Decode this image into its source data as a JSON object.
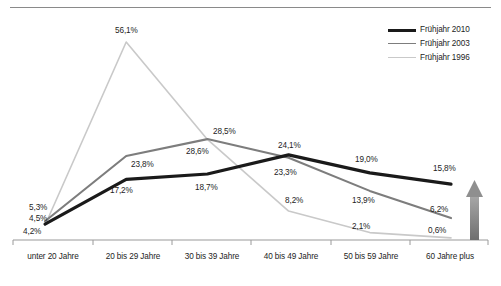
{
  "chart_data": {
    "type": "line",
    "title": "",
    "xlabel": "",
    "ylabel": "",
    "ylim": [
      0,
      60
    ],
    "grid": false,
    "legend_position": "top-right",
    "categories": [
      "unter 20 Jahre",
      "20 bis 29 Jahre",
      "30 bis 39 Jahre",
      "40 bis 49 Jahre",
      "50 bis 59 Jahre",
      "60 Jahre plus"
    ],
    "series": [
      {
        "name": "Frühjahr 2010",
        "color": "#1a1a1a",
        "values": [
          4.5,
          17.2,
          18.7,
          24.1,
          19.0,
          15.8
        ],
        "labels": [
          "4,5%",
          "17,2%",
          "18,7%",
          "24,1%",
          "19,0%",
          "15,8%"
        ]
      },
      {
        "name": "Frühjahr 2003",
        "color": "#7d7d7d",
        "values": [
          5.3,
          23.8,
          28.6,
          23.3,
          13.9,
          6.2
        ],
        "labels": [
          "5,3%",
          "23,8%",
          "28,6%",
          "23,3%",
          "13,9%",
          "6,2%"
        ]
      },
      {
        "name": "Frühjahr 1996",
        "color": "#c9c9c9",
        "values": [
          4.2,
          56.1,
          28.5,
          8.2,
          2.1,
          0.6
        ],
        "labels": [
          "4,2%",
          "56,1%",
          "28,5%",
          "8,2%",
          "2,1%",
          "0,6%"
        ]
      }
    ],
    "annotations": [
      {
        "name": "growth-arrow",
        "direction": "up",
        "color": "#8c8c8c"
      }
    ]
  },
  "legend": {
    "items": [
      {
        "label": "Frühjahr 2010",
        "color": "#1a1a1a",
        "width": "3.2px"
      },
      {
        "label": "Frühjahr 2003",
        "color": "#7d7d7d",
        "width": "1.6px"
      },
      {
        "label": "Frühjahr 1996",
        "color": "#c9c9c9",
        "width": "1.2px"
      }
    ]
  },
  "axis": {
    "categories": [
      "unter 20 Jahre",
      "20 bis 29 Jahre",
      "30 bis 39 Jahre",
      "40 bis 49 Jahre",
      "50 bis 59 Jahre",
      "60 Jahre plus"
    ]
  },
  "value_labels": {
    "s2010": [
      "4,5%",
      "17,2%",
      "18,7%",
      "24,1%",
      "19,0%",
      "15,8%"
    ],
    "s2003": [
      "5,3%",
      "23,8%",
      "28,6%",
      "23,3%",
      "13,9%",
      "6,2%"
    ],
    "s1996": [
      "4,2%",
      "56,1%",
      "28,5%",
      "8,2%",
      "2,1%",
      "0,6%"
    ]
  }
}
